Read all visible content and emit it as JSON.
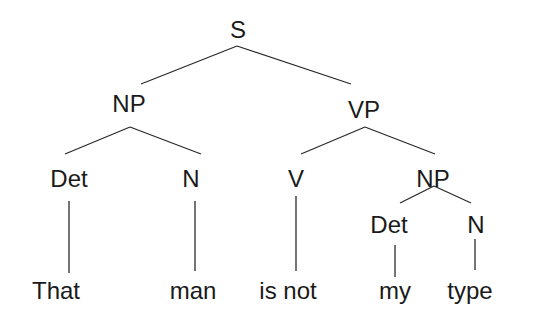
{
  "diagram": {
    "type": "syntax-tree",
    "sentence": "That man is not my type",
    "nodes": {
      "s": "S",
      "np1": "NP",
      "vp": "VP",
      "det1": "Det",
      "n1": "N",
      "v": "V",
      "np2": "NP",
      "det2": "Det",
      "n2": "N"
    },
    "leaves": {
      "that": "That",
      "man": "man",
      "is_not": "is not",
      "my": "my",
      "type": "type"
    },
    "edges": [
      [
        "S",
        "NP"
      ],
      [
        "S",
        "VP"
      ],
      [
        "NP",
        "Det"
      ],
      [
        "NP",
        "N"
      ],
      [
        "VP",
        "V"
      ],
      [
        "VP",
        "NP"
      ],
      [
        "Det",
        "That"
      ],
      [
        "N",
        "man"
      ],
      [
        "V",
        "is not"
      ],
      [
        "NP",
        "Det"
      ],
      [
        "NP",
        "N"
      ],
      [
        "Det",
        "my"
      ],
      [
        "N",
        "type"
      ]
    ]
  }
}
